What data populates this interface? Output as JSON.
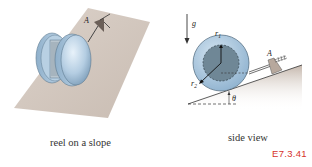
{
  "figure": {
    "id": "E7.3.41",
    "id_color": "#d6322b",
    "panels": [
      {
        "name": "reel-on-slope",
        "caption": "reel on a slope",
        "labels": {
          "anchor": "A"
        }
      },
      {
        "name": "side-view",
        "caption": "side view",
        "labels": {
          "gravity": "g",
          "inner_radius": "r",
          "inner_radius_sub": "1",
          "outer_radius": "r",
          "outer_radius_sub": "2",
          "anchor": "A",
          "angle": "θ"
        }
      }
    ],
    "colors": {
      "slope": "#c9bcb2",
      "reel_outer": "#a9c6df",
      "reel_inner": "#6f8796",
      "text": "#333333"
    }
  }
}
